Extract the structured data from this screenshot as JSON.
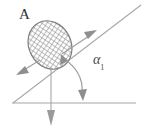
{
  "figure": {
    "background_color": "#ffffff",
    "stroke_color": "#9a9a9a",
    "hatch_color": "#8c8c8c",
    "text_color": "#3a3a3a",
    "width": 143,
    "height": 131
  },
  "labels": {
    "body_label": "A",
    "angle_symbol": "α",
    "angle_subscript": "1"
  },
  "geometry": {
    "baseline": {
      "x1": 12,
      "y1": 103,
      "x2": 136,
      "y2": 103
    },
    "incline": {
      "x1": 13,
      "y1": 103,
      "x2": 140,
      "y2": 6,
      "angle_deg": 37
    },
    "vertical_line": {
      "x": 51,
      "y1": 58,
      "y2": 124
    },
    "body": {
      "center_x": 50,
      "center_y": 45,
      "radius_x": 21,
      "radius_y": 25,
      "rotation_deg": -28
    }
  },
  "arrows": [
    {
      "name": "up-incline-arrow",
      "direction": "up-right",
      "tip_x": 96,
      "tip_y": 31
    },
    {
      "name": "down-incline-arrow",
      "direction": "down-left",
      "tip_x": 17,
      "tip_y": 74
    },
    {
      "name": "weight-arrow",
      "direction": "down",
      "tip_x": 51,
      "tip_y": 124
    },
    {
      "name": "angle-arc-arrow",
      "direction": "double-headed",
      "tip_x": 82,
      "tip_y": 98
    }
  ]
}
